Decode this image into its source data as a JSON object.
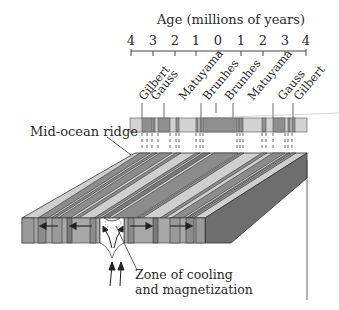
{
  "title": "Age (millions of years)",
  "axis": {
    "ticks": [
      "4",
      "3",
      "2",
      "1",
      "0",
      "1",
      "2",
      "3",
      "4"
    ]
  },
  "epochs": {
    "left": [
      "Gilbert",
      "Gauss",
      "Matuyama",
      "Brunhes"
    ],
    "right": [
      "Brunhes",
      "Matuyama",
      "Gauss",
      "Gilbert"
    ]
  },
  "labels": {
    "ridge": "Mid-ocean ridge",
    "zone_line1": "Zone of cooling",
    "zone_line2": "and magnetization"
  },
  "colors": {
    "normal": "#8c8c8c",
    "reversed": "#cfcfcf",
    "dark_side": "#6e6e6e",
    "outline": "#333333",
    "background": "#ffffff"
  }
}
